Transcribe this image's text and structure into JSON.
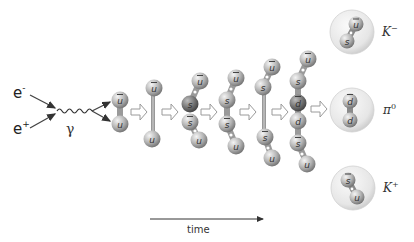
{
  "colors": {
    "quark_light": "#e6e6e6",
    "quark_dark": "#7d7d7d",
    "rod": "#9a9a9a",
    "arrow_outline": "#9a9a9a",
    "hadron_bubble": "#eeeeee",
    "text": "#222222"
  },
  "input": {
    "electron": {
      "symbol": "e",
      "charge": "-"
    },
    "positron": {
      "symbol": "e",
      "charge": "+"
    },
    "photon": {
      "symbol": "γ"
    }
  },
  "stages": [
    {
      "id": 1,
      "quarks": [
        {
          "label": "u",
          "bar": true,
          "x": 120,
          "y": 100
        },
        {
          "label": "u",
          "bar": false,
          "x": 120,
          "y": 124
        }
      ],
      "rod": false
    },
    {
      "id": 2,
      "quarks": [
        {
          "label": "u",
          "bar": true,
          "x": 154,
          "y": 88
        },
        {
          "label": "u",
          "bar": false,
          "x": 152,
          "y": 139
        }
      ],
      "rod": true
    },
    {
      "id": 3,
      "quarks": [
        {
          "label": "u",
          "bar": true,
          "x": 200,
          "y": 81
        },
        {
          "label": "s",
          "bar": false,
          "x": 190,
          "y": 104
        },
        {
          "label": "s",
          "bar": true,
          "x": 190,
          "y": 122
        },
        {
          "label": "u",
          "bar": false,
          "x": 199,
          "y": 140
        }
      ],
      "rod": false
    },
    {
      "id": 4,
      "quarks": [
        {
          "label": "u",
          "bar": true,
          "x": 236,
          "y": 78
        },
        {
          "label": "s",
          "bar": false,
          "x": 227,
          "y": 100
        },
        {
          "label": "s",
          "bar": true,
          "x": 227,
          "y": 124
        },
        {
          "label": "u",
          "bar": false,
          "x": 236,
          "y": 146
        }
      ],
      "rod": false
    },
    {
      "id": 5,
      "quarks": [
        {
          "label": "u",
          "bar": true,
          "x": 272,
          "y": 67
        },
        {
          "label": "s",
          "bar": false,
          "x": 263,
          "y": 87
        },
        {
          "label": "s",
          "bar": true,
          "x": 265,
          "y": 137
        },
        {
          "label": "u",
          "bar": false,
          "x": 272,
          "y": 158
        }
      ],
      "rod": true
    },
    {
      "id": 6,
      "quarks": [
        {
          "label": "u",
          "bar": true,
          "x": 308,
          "y": 59
        },
        {
          "label": "s",
          "bar": false,
          "x": 298,
          "y": 81
        },
        {
          "label": "d",
          "bar": false,
          "x": 298,
          "y": 103
        },
        {
          "label": "d",
          "bar": true,
          "x": 298,
          "y": 121
        },
        {
          "label": "s",
          "bar": true,
          "x": 298,
          "y": 143
        },
        {
          "label": "u",
          "bar": false,
          "x": 307,
          "y": 164
        }
      ],
      "rod": false
    }
  ],
  "hadrons": [
    {
      "name": "K",
      "charge": "−",
      "quarks": [
        "ū",
        "s"
      ]
    },
    {
      "name": "π",
      "charge": "0",
      "quarks": [
        "d",
        "d̄"
      ]
    },
    {
      "name": "K",
      "charge": "+",
      "quarks": [
        "s̄",
        "u"
      ]
    }
  ],
  "labels": {
    "q_u": "u",
    "q_s": "s",
    "q_d": "d",
    "e": "e",
    "e_minus": "-",
    "e_plus": "+",
    "gamma": "γ",
    "k_minus_name": "K",
    "k_minus_charge": "−",
    "pi0_name": "π",
    "pi0_charge": "0",
    "k_plus_name": "K",
    "k_plus_charge": "+",
    "time": "time"
  }
}
